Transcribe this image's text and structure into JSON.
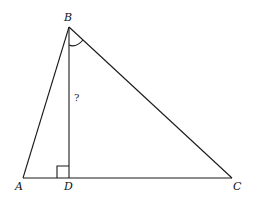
{
  "diagram": {
    "type": "triangle-with-altitude",
    "points": {
      "A": {
        "label": "A",
        "x": 23,
        "y": 178
      },
      "B": {
        "label": "B",
        "x": 69,
        "y": 27
      },
      "C": {
        "label": "C",
        "x": 232,
        "y": 178
      },
      "D": {
        "label": "D",
        "x": 69,
        "y": 178
      }
    },
    "segments": [
      "AB",
      "BC",
      "AC",
      "BD"
    ],
    "altitude": {
      "from": "B",
      "to": "D",
      "label": "?"
    },
    "right_angle_marker": "D",
    "angle_marker": "ABC",
    "labels": {
      "A": "A",
      "B": "B",
      "C": "C",
      "D": "D",
      "unknown": "?"
    }
  }
}
